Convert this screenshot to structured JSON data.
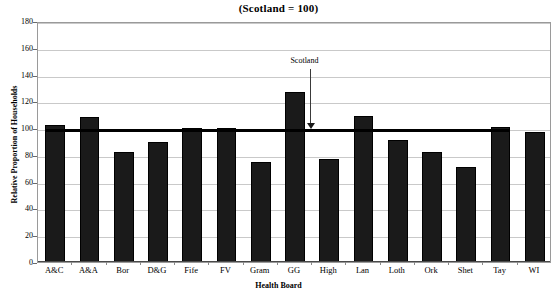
{
  "chart_data": {
    "type": "bar",
    "title": "(Scotland = 100)",
    "xlabel": "Health Board",
    "ylabel": "Relative Proportion of Households",
    "categories": [
      "A&C",
      "A&A",
      "Bor",
      "D&G",
      "Fife",
      "FV",
      "Gram",
      "GG",
      "High",
      "Lan",
      "Loth",
      "Ork",
      "Shet",
      "Tay",
      "WI"
    ],
    "values": [
      102,
      108,
      82,
      90,
      100,
      100,
      75,
      127,
      77,
      109,
      91,
      82,
      71,
      101,
      97
    ],
    "ylim": [
      0,
      180
    ],
    "yticks": [
      0,
      20,
      40,
      60,
      80,
      100,
      120,
      140,
      160,
      180
    ],
    "grid": true,
    "legend": false,
    "bar_color": "#1a1a1a",
    "reference_line": {
      "label": "Scotland",
      "value": 100,
      "color": "#000000"
    }
  }
}
